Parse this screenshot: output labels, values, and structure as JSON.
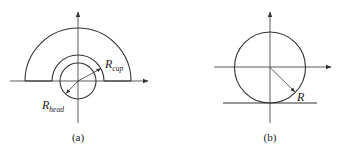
{
  "figure": {
    "panels": [
      {
        "id": "a",
        "caption": "(a)",
        "description": "Hemispherical cup surrounding a spherical head on coordinate axes",
        "labels": {
          "cap_radius": {
            "main": "R",
            "sub": "cup"
          },
          "head_radius": {
            "main": "R",
            "sub": "head"
          }
        }
      },
      {
        "id": "b",
        "caption": "(b)",
        "description": "Circle of radius R resting on a flat surface, with coordinate axes",
        "labels": {
          "radius": {
            "main": "R"
          }
        }
      }
    ],
    "colors": {
      "line": "#333333",
      "text": "#222222",
      "background": "#ffffff"
    }
  }
}
